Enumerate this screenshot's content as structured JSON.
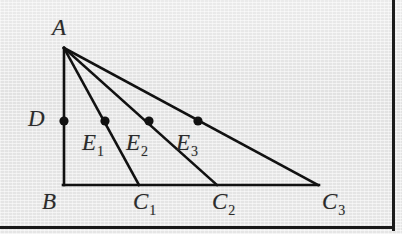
{
  "figure": {
    "type": "geometry-diagram",
    "stroke_color": "#111111",
    "background_color": "#e9e9e9",
    "border_color": "#1a1a1a",
    "points": {
      "A": {
        "label": "A",
        "subscript": "",
        "x": 64,
        "y": 48,
        "dot": false,
        "label_x": 52,
        "label_y": 16
      },
      "B": {
        "label": "B",
        "subscript": "",
        "x": 64,
        "y": 185,
        "dot": false,
        "label_x": 42,
        "label_y": 190
      },
      "C1": {
        "label": "C",
        "subscript": "1",
        "x": 139,
        "y": 185,
        "dot": false,
        "label_x": 133,
        "label_y": 190
      },
      "C2": {
        "label": "C",
        "subscript": "2",
        "x": 217,
        "y": 185,
        "dot": false,
        "label_x": 212,
        "label_y": 190
      },
      "C3": {
        "label": "C",
        "subscript": "3",
        "x": 318,
        "y": 185,
        "dot": false,
        "label_x": 322,
        "label_y": 190
      },
      "D": {
        "label": "D",
        "subscript": "",
        "x": 64,
        "y": 121,
        "dot": true,
        "label_x": 28,
        "label_y": 107
      },
      "E1": {
        "label": "E",
        "subscript": "1",
        "x": 105,
        "y": 121,
        "dot": true,
        "label_x": 82,
        "label_y": 131
      },
      "E2": {
        "label": "E",
        "subscript": "2",
        "x": 149,
        "y": 121,
        "dot": true,
        "label_x": 126,
        "label_y": 131
      },
      "E3": {
        "label": "E",
        "subscript": "3",
        "x": 198,
        "y": 121,
        "dot": true,
        "label_x": 176,
        "label_y": 131
      }
    },
    "segments": [
      {
        "name": "side-AB",
        "from": "A",
        "to": "B",
        "width": 2.6
      },
      {
        "name": "base-BC3",
        "from": "B",
        "to": "C3",
        "width": 2.6
      },
      {
        "name": "cevian-AC1",
        "from": "A",
        "to": "C1",
        "width": 2.6
      },
      {
        "name": "cevian-AC2",
        "from": "A",
        "to": "C2",
        "width": 2.6
      },
      {
        "name": "hypotenuse-AC3",
        "from": "A",
        "to": "C3",
        "width": 2.6
      }
    ],
    "dot_radius": 4.6
  }
}
